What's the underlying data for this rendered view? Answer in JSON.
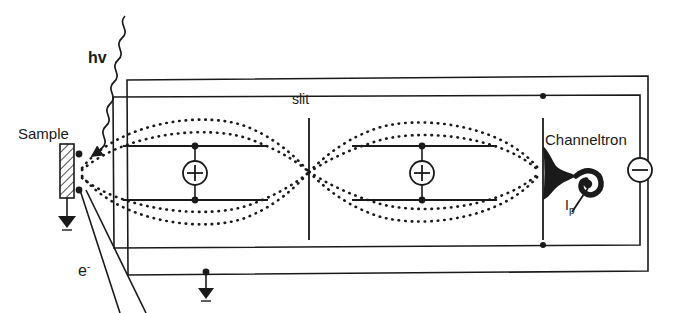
{
  "figure": {
    "kind": "schematic-diagram",
    "background_color": "#ffffff",
    "ink_color": "#1a1a1a"
  },
  "labels": {
    "sample": "Sample",
    "photon": "hv",
    "slit": "slit",
    "detector": "Channeltron",
    "current": "I",
    "current_sub": "p",
    "electron": "e",
    "electron_sup": "-"
  },
  "symbols": {
    "lens_positive": "+",
    "bias_negative": "−",
    "ground": "ground-triangle"
  },
  "components": [
    {
      "name": "sample",
      "type": "hatched-plate",
      "label": "Sample",
      "grounded": true
    },
    {
      "name": "photon-beam",
      "type": "wavy-arrow",
      "label": "hv"
    },
    {
      "name": "electron-trajectories",
      "type": "dotted-curves",
      "count": 4
    },
    {
      "name": "lens-1",
      "type": "einzel-lens",
      "polarity": "+"
    },
    {
      "name": "slit",
      "type": "aperture",
      "label": "slit"
    },
    {
      "name": "lens-2",
      "type": "einzel-lens",
      "polarity": "+"
    },
    {
      "name": "detector-aperture",
      "type": "aperture"
    },
    {
      "name": "channeltron",
      "type": "horn-spiral-detector",
      "label": "Channeltron",
      "output": "I_p"
    },
    {
      "name": "bias-supply",
      "type": "negative-terminal",
      "polarity": "−"
    },
    {
      "name": "outer-housing",
      "type": "rectangle"
    },
    {
      "name": "inner-electrode",
      "type": "rectangle",
      "grounded": true
    }
  ],
  "geometry": {
    "outer_box": {
      "x1": 127,
      "y1": 78,
      "x2": 649,
      "y2": 272
    },
    "inner_box": {
      "x1": 113,
      "y1": 96,
      "x2": 640,
      "y2": 244
    },
    "sample_plate": {
      "x": 60,
      "y": 144,
      "w": 14,
      "h": 54
    },
    "lens1_x": 195,
    "lens2_x": 422,
    "plate_top_y": 146,
    "plate_bottom_y": 200,
    "slit_x": 309,
    "slit_y1": 118,
    "slit_y2": 240,
    "detector_slit_x": 543,
    "channeltron_x": 552,
    "channeltron_y": 172,
    "bias_x": 640,
    "bias_y": 170,
    "focus_x": 309,
    "focus_y": 172,
    "source_x": 80,
    "source_y": 172
  }
}
